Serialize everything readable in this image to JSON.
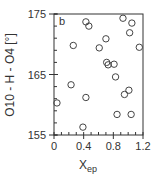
{
  "chart_data": {
    "type": "scatter",
    "panel_label": "b",
    "title": "",
    "xlabel": "X",
    "xlabel_subscript": "ep",
    "ylabel": "O10 - H - O4 [°]",
    "xlim": [
      0,
      1.2
    ],
    "ylim": [
      155,
      175
    ],
    "x_ticks": [
      "0",
      "0.4",
      "0.8",
      "1.2"
    ],
    "y_ticks": [
      "155",
      "165",
      "175"
    ],
    "x_minor_step": 0.1,
    "y_minor_step": 2,
    "grid": false,
    "legend": null,
    "marker": "open-circle",
    "series": [
      {
        "name": "data",
        "points": [
          [
            0.43,
            173.7
          ],
          [
            0.47,
            173.0
          ],
          [
            0.26,
            169.8
          ],
          [
            0.93,
            174.3
          ],
          [
            1.05,
            173.5
          ],
          [
            1.02,
            171.9
          ],
          [
            0.7,
            170.9
          ],
          [
            0.61,
            169.4
          ],
          [
            1.15,
            169.5
          ],
          [
            0.71,
            167.0
          ],
          [
            0.73,
            166.6
          ],
          [
            0.81,
            166.7
          ],
          [
            0.83,
            164.6
          ],
          [
            1.01,
            162.4
          ],
          [
            0.95,
            161.7
          ],
          [
            0.23,
            163.3
          ],
          [
            0.43,
            161.2
          ],
          [
            0.04,
            160.3
          ],
          [
            0.85,
            158.4
          ],
          [
            1.04,
            158.4
          ],
          [
            0.39,
            156.3
          ]
        ]
      }
    ]
  },
  "colors": {
    "axis": "#333333",
    "marker": "#444444",
    "background": "#ffffff"
  }
}
